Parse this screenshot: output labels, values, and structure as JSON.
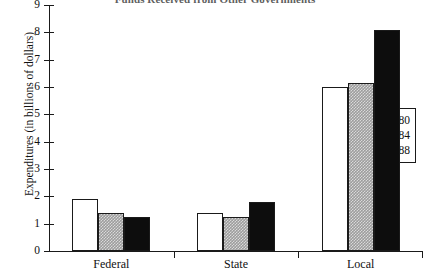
{
  "chart_data": {
    "type": "bar",
    "title": "Funds Received from Other Governments",
    "xlabel": "",
    "ylabel": "Expenditures (in billions of dollars)",
    "categories": [
      "Federal",
      "State",
      "Local"
    ],
    "series": [
      {
        "name": "1980",
        "values": [
          1.9,
          1.4,
          6.0
        ],
        "color": "#ffffff",
        "swatch": "fill-1980"
      },
      {
        "name": "1984",
        "values": [
          1.4,
          1.25,
          6.15
        ],
        "color": "#9d9d9d",
        "swatch": "fill-1984"
      },
      {
        "name": "1988",
        "values": [
          1.25,
          1.8,
          8.1
        ],
        "color": "#0d0d0d",
        "swatch": "fill-1988"
      }
    ],
    "ylim": [
      0,
      9
    ],
    "yticks": [
      0,
      1,
      2,
      3,
      4,
      5,
      6,
      7,
      8,
      9
    ],
    "ytick_labels": [
      "0",
      "1",
      "2",
      "3",
      "4",
      "5",
      "6",
      "7",
      "8",
      "9"
    ],
    "grid": false,
    "legend_position": "right"
  }
}
